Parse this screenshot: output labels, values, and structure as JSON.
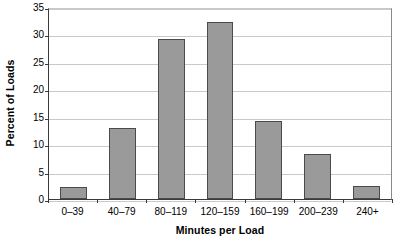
{
  "chart_data": {
    "type": "bar",
    "title": "",
    "subtitle": "",
    "xlabel": "Minutes per Load",
    "ylabel": "Percent of Loads",
    "categories": [
      "0–39",
      "40–79",
      "80–119",
      "120–159",
      "160–199",
      "200–239",
      "240+"
    ],
    "values": [
      2.2,
      13.0,
      29.2,
      32.3,
      14.2,
      8.2,
      2.4
    ],
    "ylim": [
      0,
      35
    ],
    "ytick_labels": [
      "0",
      "5",
      "10",
      "15",
      "20",
      "25",
      "30",
      "35"
    ],
    "ytick_values": [
      0,
      5,
      10,
      15,
      20,
      25,
      30,
      35
    ],
    "grid": "horizontal",
    "legend": "none",
    "annotations": [],
    "colors": {
      "bar_fill": "#9a9a9a",
      "bar_border": "#4a4a4a",
      "gridline": "#c9c9c9",
      "axis": "#3a3a3a",
      "background": "#ffffff",
      "text": "#000000"
    }
  }
}
